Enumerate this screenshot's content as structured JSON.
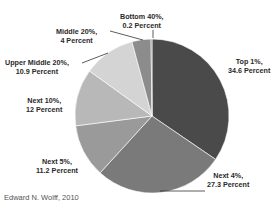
{
  "chart_data": {
    "type": "pie",
    "title": "",
    "categories": [
      "Top 1%",
      "Next 4%",
      "Next 5%",
      "Next 10%",
      "Upper Middle 20%",
      "Middle 20%",
      "Bottom 40%"
    ],
    "values": [
      34.6,
      27.3,
      11.2,
      12,
      10.9,
      4,
      0.2
    ],
    "labels": [
      {
        "group": "Top 1%,",
        "value": "34.6 Percent"
      },
      {
        "group": "Next 4%,",
        "value": "27.3 Percent"
      },
      {
        "group": "Next 5%,",
        "value": "11.2 Percent"
      },
      {
        "group": "Next 10%,",
        "value": "12 Percent"
      },
      {
        "group": "Upper Middle 20%,",
        "value": "10.9 Percent"
      },
      {
        "group": "Middle 20%,",
        "value": "4 Percent"
      },
      {
        "group": "Bottom 40%,",
        "value": "0.2 Percent"
      }
    ],
    "colors": [
      "#4a4a4a",
      "#7a7a7a",
      "#9a9a9a",
      "#b8b8b8",
      "#d4d4d4",
      "#8c8c8c",
      "#6e6e6e"
    ],
    "start_angle": "top (12 o'clock)",
    "direction": "clockwise",
    "legend": "none (data labels outside slices)"
  },
  "source": "Edward N. Wolff, 2010"
}
